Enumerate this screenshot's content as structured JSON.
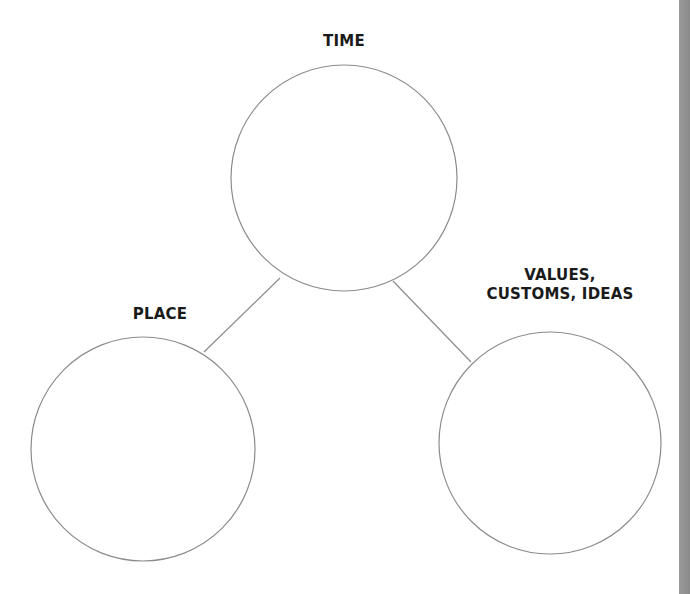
{
  "diagram": {
    "type": "web-organizer",
    "nodes": [
      {
        "id": "time",
        "label_lines": [
          "TIME"
        ]
      },
      {
        "id": "place",
        "label_lines": [
          "PLACE"
        ]
      },
      {
        "id": "values",
        "label_lines": [
          "VALUES,",
          "CUSTOMS, IDEAS"
        ]
      }
    ],
    "edges": [
      {
        "from": "time",
        "to": "place"
      },
      {
        "from": "time",
        "to": "values"
      }
    ],
    "colors": {
      "stroke": "#8c8c8c",
      "text": "#1a1a1a",
      "edge_bar": "#949494",
      "background": "#ffffff"
    }
  },
  "labels": {
    "time": "TIME",
    "place": "PLACE",
    "values_line1": "VALUES,",
    "values_line2": "CUSTOMS, IDEAS"
  }
}
